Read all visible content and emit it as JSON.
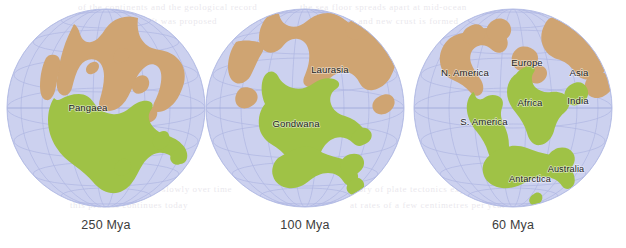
{
  "figure": {
    "background_color": "#ffffff",
    "ocean_color": "#ccd2ef",
    "graticule_color": "#a9b2df",
    "land_green_color": "#9fc246",
    "land_tan_color": "#cfa472",
    "label_color": "#23241f",
    "caption_color": "#3c3c3c"
  },
  "globes": [
    {
      "id": "globe-250mya",
      "caption": "250 Mya",
      "caption_x": 106,
      "center_x": 106,
      "center_y": 108,
      "radius": 99,
      "labels": [
        {
          "text": "Pangaea",
          "x": 88,
          "y": 108
        }
      ]
    },
    {
      "id": "globe-100mya",
      "caption": "100 Mya",
      "caption_x": 305,
      "center_x": 305,
      "center_y": 108,
      "radius": 99,
      "labels": [
        {
          "text": "Laurasia",
          "x": 330,
          "y": 70
        },
        {
          "text": "Gondwana",
          "x": 296,
          "y": 124
        }
      ]
    },
    {
      "id": "globe-60mya",
      "caption": "60 Mya",
      "caption_x": 513,
      "center_x": 513,
      "center_y": 108,
      "radius": 99,
      "labels": [
        {
          "text": "N. America",
          "x": 465,
          "y": 73
        },
        {
          "text": "Europe",
          "x": 527,
          "y": 63
        },
        {
          "text": "Asia",
          "x": 579,
          "y": 73
        },
        {
          "text": "Africa",
          "x": 530,
          "y": 103
        },
        {
          "text": "India",
          "x": 578,
          "y": 101
        },
        {
          "text": "S. America",
          "x": 484,
          "y": 122
        },
        {
          "text": "Antarctica",
          "x": 530,
          "y": 179
        },
        {
          "text": "Australia",
          "x": 564,
          "y": 169
        }
      ]
    }
  ],
  "bleed_text": [
    {
      "text": "of the continents and the geological record",
      "x": 78,
      "y": 4
    },
    {
      "text": "the sea floor spreads apart at mid-ocean",
      "x": 300,
      "y": 4
    },
    {
      "text": "continental drift was proposed",
      "x": 90,
      "y": 18
    },
    {
      "text": "ridges and new crust is formed",
      "x": 320,
      "y": 18
    },
    {
      "text": "evidence from fossils",
      "x": 470,
      "y": 32
    },
    {
      "text": "continental plates move slowly over time",
      "x": 70,
      "y": 186
    },
    {
      "text": "the theory of plate tectonics explains",
      "x": 330,
      "y": 186
    },
    {
      "text": "this process continues today",
      "x": 80,
      "y": 202
    },
    {
      "text": "at rates of a few centimetres per year",
      "x": 350,
      "y": 202
    }
  ]
}
